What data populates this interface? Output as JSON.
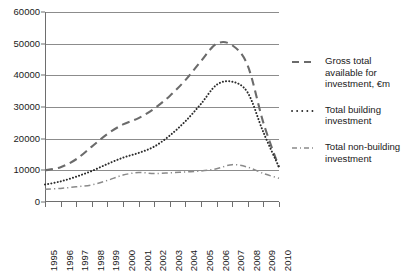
{
  "chart_data": {
    "type": "line",
    "title": "",
    "xlabel": "",
    "ylabel": "",
    "grid": "horizontal",
    "legend_position": "right",
    "xlim": [
      1995,
      2010
    ],
    "ylim": [
      0,
      60000
    ],
    "ytick_step": 10000,
    "categories": [
      "1995",
      "1996",
      "1997",
      "1998",
      "1999",
      "2000",
      "2001",
      "2002",
      "2003",
      "2004",
      "2005",
      "2006",
      "2007",
      "2008",
      "2009",
      "2010"
    ],
    "ytick_labels": [
      "0",
      "10000",
      "20000",
      "30000",
      "40000",
      "50000",
      "60000"
    ],
    "series": [
      {
        "name": "Gross total available for investment, €m",
        "style": "dashed",
        "color": "#6b6b6b",
        "values": [
          10000,
          11000,
          13500,
          17500,
          21500,
          24500,
          26500,
          29500,
          33500,
          38500,
          44500,
          50000,
          49500,
          43000,
          25000,
          11000
        ]
      },
      {
        "name": "Total building investment",
        "style": "dotted",
        "color": "#2b2b2b",
        "values": [
          5500,
          6500,
          8000,
          9800,
          12000,
          14000,
          15500,
          17500,
          21000,
          25500,
          31000,
          37000,
          38000,
          34500,
          22000,
          11000
        ]
      },
      {
        "name": "Total non-building investment",
        "style": "dashdot",
        "color": "#8a8a8a",
        "values": [
          4000,
          4300,
          4800,
          5400,
          6800,
          8500,
          9300,
          9000,
          9200,
          9500,
          9800,
          10500,
          11800,
          11000,
          9000,
          7500
        ]
      }
    ]
  },
  "legend": {
    "items": [
      {
        "label": "Gross total available for investment, €m",
        "swatch": "dashed-line-swatch"
      },
      {
        "label": "Total building investment",
        "swatch": "dotted-line-swatch"
      },
      {
        "label": "Total non-building investment",
        "swatch": "dash-dot-line-swatch"
      }
    ]
  }
}
